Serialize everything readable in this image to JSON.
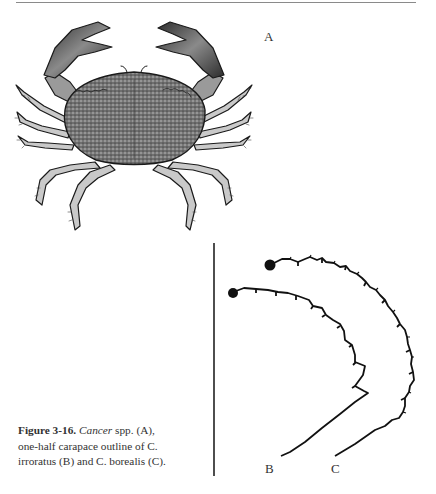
{
  "page": {
    "header_rule": true
  },
  "figure": {
    "labels": {
      "a": "A",
      "b": "B",
      "c": "C"
    },
    "panels": [
      {
        "id": "A",
        "description": "Illustration of Cancer crab, dorsal view"
      },
      {
        "id": "B",
        "description": "One-half carapace outline of C. irroratus"
      },
      {
        "id": "C",
        "description": "One-half carapace outline of C. borealis"
      }
    ]
  },
  "caption": {
    "number": "Figure 3-16.",
    "genus": "Cancer",
    "text_1": " spp. (A),",
    "text_2": "one-half carapace outline of C.",
    "text_3": "irroratus (B) and C. borealis (C)."
  },
  "colors": {
    "ink": "#1a1a1a",
    "rule": "#8a8a8a",
    "text": "#333333"
  }
}
